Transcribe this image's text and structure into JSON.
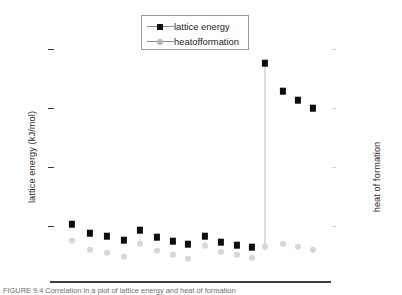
{
  "legend": {
    "position": "top-center",
    "entries": [
      {
        "label": "lattice energy",
        "marker": "square-marker",
        "color": "#0d0d0d"
      },
      {
        "label": "heatofformation",
        "marker": "circle-marker",
        "color": "#d7d7d7"
      }
    ]
  },
  "axes": {
    "y_left_label": "lattice energy (kJ/mol)",
    "y_right_label": "heat of formation",
    "x_label": "",
    "y_left_tick_count": 4,
    "y_right_tick_count": 4
  },
  "caption": {
    "text": "FIGURE 9.4      Correlation in a plot of lattice energy and heat of formation"
  },
  "chart_data": {
    "type": "scatter",
    "title": "",
    "subtitle": "",
    "xlabel": "",
    "ylabel": "lattice energy (kJ/mol)",
    "y2label": "heat of formation",
    "grid": false,
    "legend_position": "top-center",
    "xlim": [
      0,
      17
    ],
    "ylim": [
      0,
      4
    ],
    "y_tick_positions": [
      1,
      2,
      3,
      4
    ],
    "x_tick_labels": [],
    "y_tick_labels": [],
    "annotations": [
      {
        "text": "vertical connector at compound 13",
        "x": 13,
        "type": "vline"
      }
    ],
    "x": [
      1,
      2,
      3,
      4,
      5,
      6,
      7,
      8,
      9,
      10,
      11,
      12,
      13,
      14,
      15,
      16
    ],
    "series": [
      {
        "name": "lattice energy",
        "marker": "square",
        "color": "#0d0d0d",
        "axis": "left",
        "values": [
          1.0,
          0.88,
          0.83,
          0.76,
          0.94,
          0.8,
          0.74,
          0.68,
          0.83,
          0.71,
          0.66,
          0.62,
          3.63,
          3.15,
          2.92,
          2.72
        ]
      },
      {
        "name": "heatofformation",
        "marker": "circle",
        "color": "#d7d7d7",
        "axis": "right",
        "values": [
          0.7,
          0.48,
          0.41,
          0.3,
          0.63,
          0.43,
          0.35,
          0.27,
          0.59,
          0.4,
          0.33,
          0.26,
          0.66,
          0.7,
          0.63,
          0.58
        ]
      }
    ]
  },
  "geometry": {
    "plot_left": 67,
    "plot_right": 331,
    "y_top_px": 49,
    "y_bottom_px": 265,
    "tick_px": [
      49,
      108,
      167,
      226
    ],
    "axis_line_y": 281,
    "point_px": [
      {
        "x": 72,
        "sq": 224,
        "ci": 241
      },
      {
        "x": 90,
        "sq": 233,
        "ci": 250
      },
      {
        "x": 107,
        "sq": 236,
        "ci": 253
      },
      {
        "x": 124,
        "sq": 240,
        "ci": 257
      },
      {
        "x": 140,
        "sq": 230,
        "ci": 244
      },
      {
        "x": 157,
        "sq": 237,
        "ci": 251
      },
      {
        "x": 173,
        "sq": 241,
        "ci": 255
      },
      {
        "x": 188,
        "sq": 244,
        "ci": 259
      },
      {
        "x": 205,
        "sq": 236,
        "ci": 246
      },
      {
        "x": 221,
        "sq": 242,
        "ci": 252
      },
      {
        "x": 237,
        "sq": 245,
        "ci": 255
      },
      {
        "x": 252,
        "sq": 247,
        "ci": 258
      },
      {
        "x": 265,
        "sq": 63,
        "ci": 247
      },
      {
        "x": 283,
        "sq": 91,
        "ci": 244
      },
      {
        "x": 298,
        "sq": 100,
        "ci": 247
      },
      {
        "x": 313,
        "sq": 108,
        "ci": 250
      }
    ],
    "right_tick_px": [
      49,
      108,
      167,
      226
    ]
  }
}
